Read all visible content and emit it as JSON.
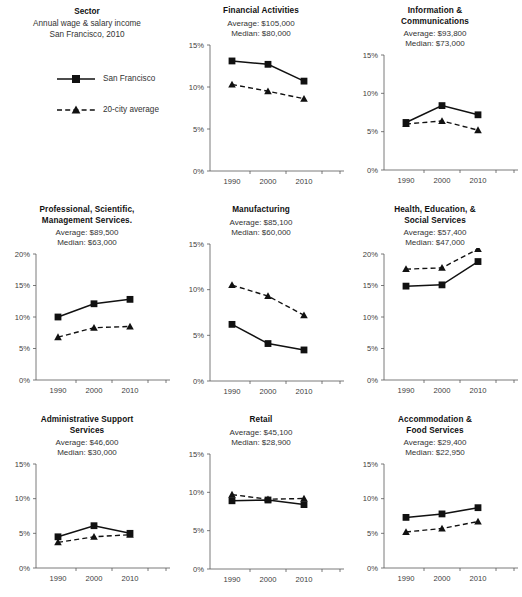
{
  "legend_panel": {
    "title": "Sector",
    "subtitle_line1": "Annual wage & salary income",
    "subtitle_line2": "San Francisco, 2010",
    "series": [
      {
        "key": "sf",
        "label": "San Francisco",
        "style": "solid-square"
      },
      {
        "key": "avg20",
        "label": "20-city average",
        "style": "dashed-triangle"
      }
    ]
  },
  "chart_data": [
    {
      "type": "line",
      "title": "Financial Activities",
      "title_lines": [
        "Financial Activities"
      ],
      "average_label": "Average: $105,000",
      "median_label": "Median: $80,000",
      "categories": [
        "1990",
        "2000",
        "2010"
      ],
      "x": [
        1990,
        2000,
        2010
      ],
      "xlabel": "",
      "ylabel": "",
      "ylim": [
        0,
        15
      ],
      "yticks": [
        0,
        5,
        10,
        15
      ],
      "ytick_labels": [
        "0%",
        "5%",
        "10%",
        "15%"
      ],
      "grid": false,
      "legend": "external",
      "series": [
        {
          "name": "San Francisco",
          "values": [
            13.1,
            12.7,
            10.7
          ]
        },
        {
          "name": "20-city average",
          "values": [
            10.3,
            9.5,
            8.6
          ]
        }
      ]
    },
    {
      "type": "line",
      "title": "Information & Communications",
      "title_lines": [
        "Information &",
        "Communications"
      ],
      "average_label": "Average: $93,800",
      "median_label": "Median: $73,000",
      "categories": [
        "1990",
        "2000",
        "2010"
      ],
      "x": [
        1990,
        2000,
        2010
      ],
      "xlabel": "",
      "ylabel": "",
      "ylim": [
        0,
        15
      ],
      "yticks": [
        0,
        5,
        10,
        15
      ],
      "ytick_labels": [
        "0%",
        "5%",
        "10%",
        "15%"
      ],
      "grid": false,
      "legend": "external",
      "series": [
        {
          "name": "San Francisco",
          "values": [
            6.2,
            8.4,
            7.2
          ]
        },
        {
          "name": "20-city average",
          "values": [
            6.0,
            6.4,
            5.2
          ]
        }
      ]
    },
    {
      "type": "line",
      "title": "Professional, Scientific, Management Services.",
      "title_lines": [
        "Professional, Scientific,",
        "Management Services."
      ],
      "average_label": "Average: $89,500",
      "median_label": "Median: $63,000",
      "categories": [
        "1990",
        "2000",
        "2010"
      ],
      "x": [
        1990,
        2000,
        2010
      ],
      "xlabel": "",
      "ylabel": "",
      "ylim": [
        0,
        20
      ],
      "yticks": [
        0,
        5,
        10,
        15,
        20
      ],
      "ytick_labels": [
        "0%",
        "5%",
        "10%",
        "15%",
        "20%"
      ],
      "grid": false,
      "legend": "external",
      "series": [
        {
          "name": "San Francisco",
          "values": [
            10.0,
            12.1,
            12.8
          ]
        },
        {
          "name": "20-city average",
          "values": [
            6.8,
            8.3,
            8.5
          ]
        }
      ]
    },
    {
      "type": "line",
      "title": "Manufacturing",
      "title_lines": [
        "Manufacturing"
      ],
      "average_label": "Average: $85,100",
      "median_label": "Median: $60,000",
      "categories": [
        "1990",
        "2000",
        "2010"
      ],
      "x": [
        1990,
        2000,
        2010
      ],
      "xlabel": "",
      "ylabel": "",
      "ylim": [
        0,
        15
      ],
      "yticks": [
        0,
        5,
        10,
        15
      ],
      "ytick_labels": [
        "0%",
        "5%",
        "10%",
        "15%"
      ],
      "grid": false,
      "legend": "external",
      "series": [
        {
          "name": "San Francisco",
          "values": [
            6.2,
            4.1,
            3.4
          ]
        },
        {
          "name": "20-city average",
          "values": [
            10.5,
            9.3,
            7.2
          ]
        }
      ]
    },
    {
      "type": "line",
      "title": "Health, Education, & Social Services",
      "title_lines": [
        "Health, Education, &",
        "Social Services"
      ],
      "average_label": "Average: $57,400",
      "median_label": "Median: $47,000",
      "categories": [
        "1990",
        "2000",
        "2010"
      ],
      "x": [
        1990,
        2000,
        2010
      ],
      "xlabel": "",
      "ylabel": "",
      "ylim": [
        0,
        20
      ],
      "yticks": [
        0,
        5,
        10,
        15,
        20
      ],
      "ytick_labels": [
        "0%",
        "5%",
        "10%",
        "15%",
        "20%"
      ],
      "grid": false,
      "legend": "external",
      "series": [
        {
          "name": "San Francisco",
          "values": [
            14.9,
            15.1,
            18.8
          ]
        },
        {
          "name": "20-city average",
          "values": [
            17.6,
            17.8,
            20.8
          ]
        }
      ]
    },
    {
      "type": "line",
      "title": "Administrative Support Services",
      "title_lines": [
        "Administrative Support",
        "Services"
      ],
      "average_label": "Average: $46,600",
      "median_label": "Median: $30,000",
      "categories": [
        "1990",
        "2000",
        "2010"
      ],
      "x": [
        1990,
        2000,
        2010
      ],
      "xlabel": "",
      "ylabel": "",
      "ylim": [
        0,
        15
      ],
      "yticks": [
        0,
        5,
        10,
        15
      ],
      "ytick_labels": [
        "0%",
        "5%",
        "10%",
        "15%"
      ],
      "grid": false,
      "legend": "external",
      "series": [
        {
          "name": "San Francisco",
          "values": [
            4.5,
            6.1,
            5.0
          ]
        },
        {
          "name": "20-city average",
          "values": [
            3.7,
            4.5,
            4.8
          ]
        }
      ]
    },
    {
      "type": "line",
      "title": "Retail",
      "title_lines": [
        "Retail"
      ],
      "average_label": "Average: $45,100",
      "median_label": "Median: $28,900",
      "categories": [
        "1990",
        "2000",
        "2010"
      ],
      "x": [
        1990,
        2000,
        2010
      ],
      "xlabel": "",
      "ylabel": "",
      "ylim": [
        0,
        15
      ],
      "yticks": [
        0,
        5,
        10,
        15
      ],
      "ytick_labels": [
        "0%",
        "5%",
        "10%",
        "15%"
      ],
      "grid": false,
      "legend": "external",
      "series": [
        {
          "name": "San Francisco",
          "values": [
            8.9,
            9.0,
            8.4
          ]
        },
        {
          "name": "20-city average",
          "values": [
            9.7,
            9.1,
            9.2
          ]
        }
      ]
    },
    {
      "type": "line",
      "title": "Accommodation & Food Services",
      "title_lines": [
        "Accommodation &",
        "Food Services"
      ],
      "average_label": "Average: $29,400",
      "median_label": "Median: $22,950",
      "categories": [
        "1990",
        "2000",
        "2010"
      ],
      "x": [
        1990,
        2000,
        2010
      ],
      "xlabel": "",
      "ylabel": "",
      "ylim": [
        0,
        15
      ],
      "yticks": [
        0,
        5,
        10,
        15
      ],
      "ytick_labels": [
        "0%",
        "5%",
        "10%",
        "15%"
      ],
      "grid": false,
      "legend": "external",
      "series": [
        {
          "name": "San Francisco",
          "values": [
            7.3,
            7.8,
            8.7
          ]
        },
        {
          "name": "20-city average",
          "values": [
            5.2,
            5.7,
            6.7
          ]
        }
      ]
    }
  ],
  "colors": {
    "line": "#111111",
    "axis": "#595959",
    "text": "#333333",
    "background": "#ffffff"
  }
}
